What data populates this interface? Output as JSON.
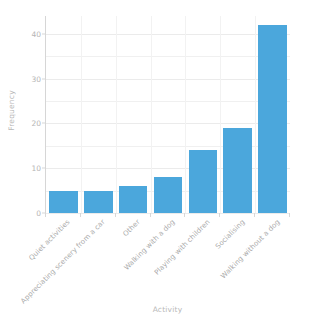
{
  "chart_data": {
    "type": "bar",
    "title": "",
    "subtitle": "",
    "xlabel": "Activity",
    "ylabel": "Frequency",
    "categories": [
      "Quiet activities",
      "Appreciating scenery from a car",
      "Other",
      "Walking with a dog",
      "Playing with children",
      "Socialising",
      "Walking without a dog"
    ],
    "values": [
      5,
      5,
      6,
      8,
      14,
      19,
      42
    ],
    "ylim": [
      0,
      44
    ],
    "yticks": [
      0,
      10,
      20,
      30,
      40
    ],
    "ytick_labels": [
      "0",
      "10",
      "20",
      "30",
      "40"
    ],
    "yminor_step": 5,
    "grid": true,
    "grid_axis": "both",
    "legend": false,
    "legend_position": "none",
    "bar_color": "#4ba7dc",
    "background_color": "#ffffff",
    "grid_color": "#f0f0f0",
    "axis_color": "#d6d6d6",
    "tick_label_color": "#b5b5b5",
    "axis_label_color": "#b9b9b9",
    "xtick_rotation_degrees": 45
  }
}
